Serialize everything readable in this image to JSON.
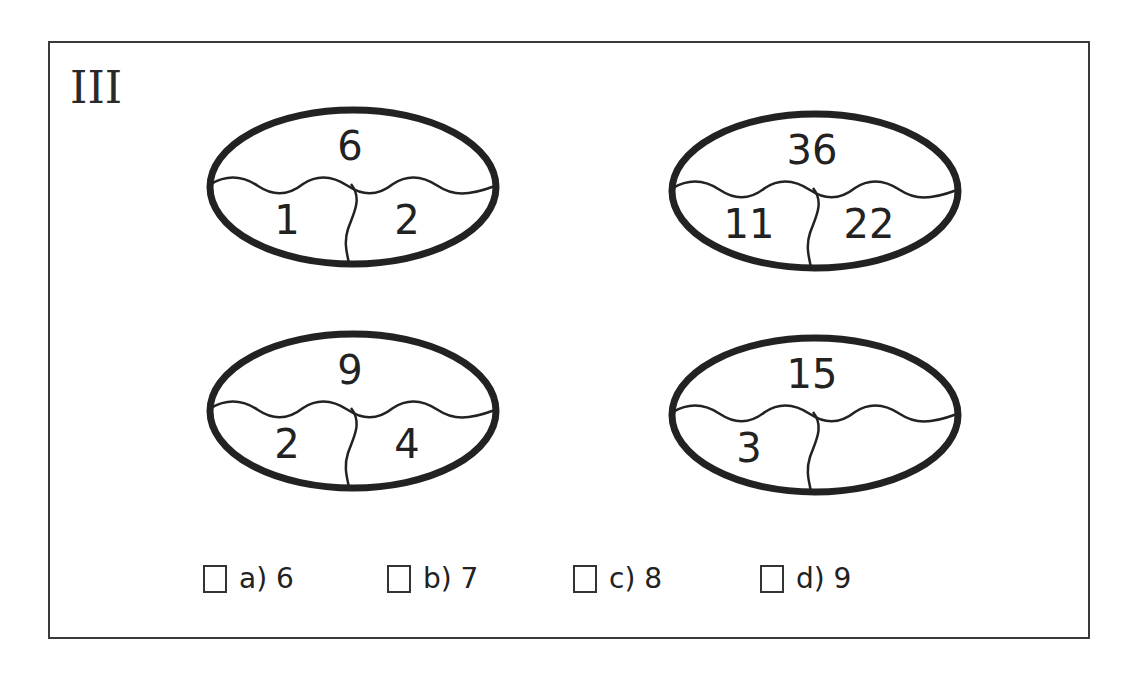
{
  "puzzle": {
    "label": "III",
    "ovals": [
      {
        "top": "6",
        "left": "1",
        "right": "2"
      },
      {
        "top": "36",
        "left": "11",
        "right": "22"
      },
      {
        "top": "9",
        "left": "2",
        "right": "4"
      },
      {
        "top": "15",
        "left": "3",
        "right": ""
      }
    ],
    "options": [
      {
        "label": "a) 6"
      },
      {
        "label": "b) 7"
      },
      {
        "label": "c) 8"
      },
      {
        "label": "d) 9"
      }
    ]
  }
}
